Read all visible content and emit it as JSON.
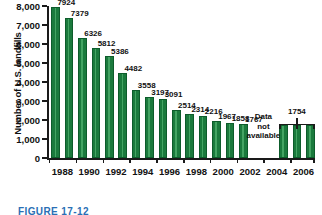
{
  "chart_data": {
    "type": "bar",
    "title": "",
    "xlabel": "",
    "ylabel": "Number of U.S. landfills",
    "ylim": [
      0,
      8000
    ],
    "ytick_labels": [
      "0",
      "1,000",
      "2,000",
      "3,000",
      "4,000",
      "5,000",
      "6,000",
      "7,000",
      "8,000"
    ],
    "ytick_values": [
      0,
      1000,
      2000,
      3000,
      4000,
      5000,
      6000,
      7000,
      8000
    ],
    "xtick_labels": [
      "1988",
      "1990",
      "1992",
      "1994",
      "1996",
      "1998",
      "2000",
      "2002",
      "2004",
      "2006"
    ],
    "xtick_values": [
      1988,
      1990,
      1992,
      1994,
      1996,
      1998,
      2000,
      2002,
      2004,
      2006
    ],
    "grid": false,
    "legend": false,
    "categories": [
      "1988",
      "1989",
      "1990",
      "1991",
      "1992",
      "1993",
      "1994",
      "1995",
      "1996",
      "1997",
      "1998",
      "1999",
      "2000",
      "2001",
      "2002",
      "2005",
      "2006",
      "2007"
    ],
    "values": [
      7924,
      7379,
      6326,
      5812,
      5386,
      4482,
      3558,
      3197,
      3091,
      2514,
      2314,
      2216,
      1967,
      1858,
      1767,
      1754,
      1754,
      1754
    ],
    "data_labels": [
      "7924",
      "7379",
      "6326",
      "5812",
      "5386",
      "4482",
      "3558",
      "3197",
      "3091",
      "2514",
      "2314",
      "2216",
      "1967",
      "1858",
      "1767",
      "",
      "",
      ""
    ],
    "annotations": [
      {
        "text_lines": [
          "Data",
          "not",
          "available"
        ],
        "kind": "gap-note"
      },
      {
        "text": "1754",
        "kind": "bracket-label"
      }
    ]
  },
  "caption": {
    "text": "FIGURE 17-12"
  },
  "colors": {
    "bar_fill": "#1b7a3d",
    "bar_sheen": "#44a463",
    "bar_edge": "#0d5c2b",
    "axis": "#1a1a1a",
    "text": "#111111",
    "caption": "#2a6fb5",
    "background": "#ffffff"
  }
}
